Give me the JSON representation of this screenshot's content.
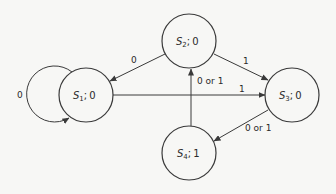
{
  "diagram": {
    "type": "state-machine",
    "nodes": [
      {
        "id": "S1",
        "name": "S",
        "sub": "1",
        "output": "0",
        "cx": 86,
        "cy": 95,
        "r": 27
      },
      {
        "id": "S2",
        "name": "S",
        "sub": "2",
        "output": "0",
        "cx": 189,
        "cy": 41,
        "r": 27
      },
      {
        "id": "S3",
        "name": "S",
        "sub": "3",
        "output": "0",
        "cx": 292,
        "cy": 95,
        "r": 27
      },
      {
        "id": "S4",
        "name": "S",
        "sub": "4",
        "output": "1",
        "cx": 189,
        "cy": 153,
        "r": 27
      }
    ],
    "edges": [
      {
        "from": "S1",
        "to": "S1",
        "label": "0"
      },
      {
        "from": "S2",
        "to": "S1",
        "label": "0"
      },
      {
        "from": "S1",
        "to": "S3",
        "label": "1"
      },
      {
        "from": "S2",
        "to": "S3",
        "label": "1"
      },
      {
        "from": "S3",
        "to": "S4",
        "label": "0 or 1"
      },
      {
        "from": "S4",
        "to": "S2",
        "label": "0 or 1"
      }
    ],
    "separator": ";"
  }
}
